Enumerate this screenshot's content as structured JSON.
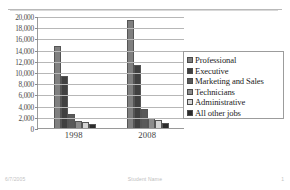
{
  "footer": {
    "date": "6/7/2005",
    "center": "Student Name",
    "page": "1"
  },
  "chart_data": {
    "type": "bar",
    "title": "",
    "xlabel": "",
    "ylabel": "",
    "categories": [
      "1998",
      "2008"
    ],
    "ylim": [
      0,
      20000
    ],
    "ytick_labels": [
      "20,000",
      "18,000",
      "16,000",
      "14,000",
      "12,000",
      "10,000",
      "8,000",
      "6,000",
      "4,000",
      "2,000",
      "0"
    ],
    "ytick_values": [
      20000,
      18000,
      16000,
      14000,
      12000,
      10000,
      8000,
      6000,
      4000,
      2000,
      0
    ],
    "grid": true,
    "legend_position": "right",
    "series": [
      {
        "name": "Professional",
        "color": "#7f7f7f",
        "values": [
          14700,
          19200
        ]
      },
      {
        "name": "Executive",
        "color": "#404040",
        "values": [
          9200,
          11300
        ]
      },
      {
        "name": "Marketing and Sales",
        "color": "#595959",
        "values": [
          2500,
          3400
        ]
      },
      {
        "name": "Technicians",
        "color": "#8c8c8c",
        "values": [
          1250,
          1750
        ]
      },
      {
        "name": "Administrative",
        "color": "#d4d4d4",
        "values": [
          1150,
          1400
        ]
      },
      {
        "name": "All other jobs",
        "color": "#2b2b2b",
        "values": [
          700,
          900
        ]
      }
    ]
  }
}
